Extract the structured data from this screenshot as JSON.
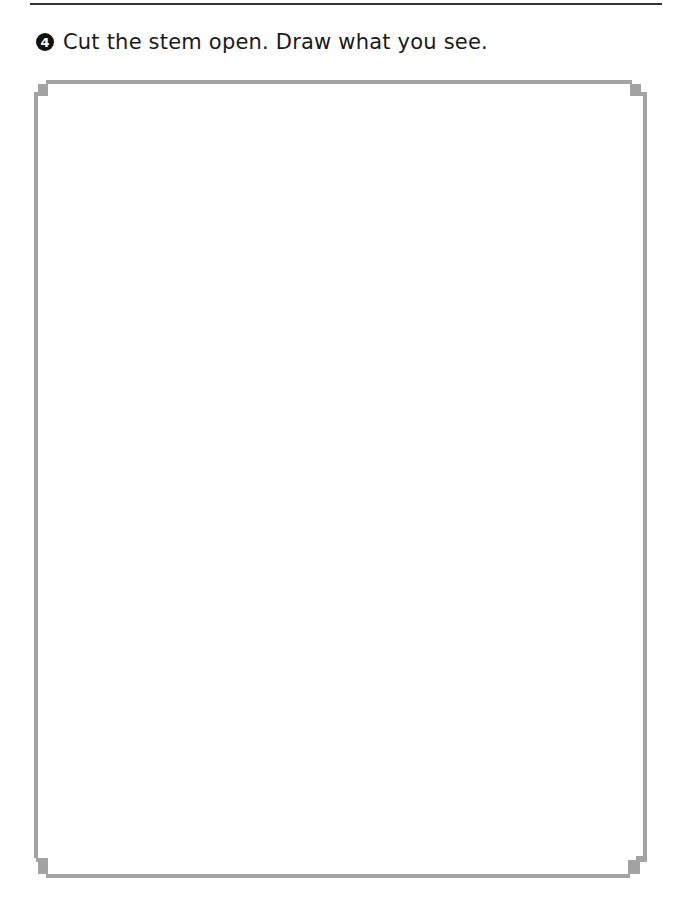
{
  "worksheet": {
    "question": {
      "number": "4",
      "text": "Cut the stem open. Draw what you see."
    },
    "drawing_box": {
      "label": "drawing-area",
      "border_color": "#a3a3a3"
    },
    "rule_color": "#333333"
  }
}
